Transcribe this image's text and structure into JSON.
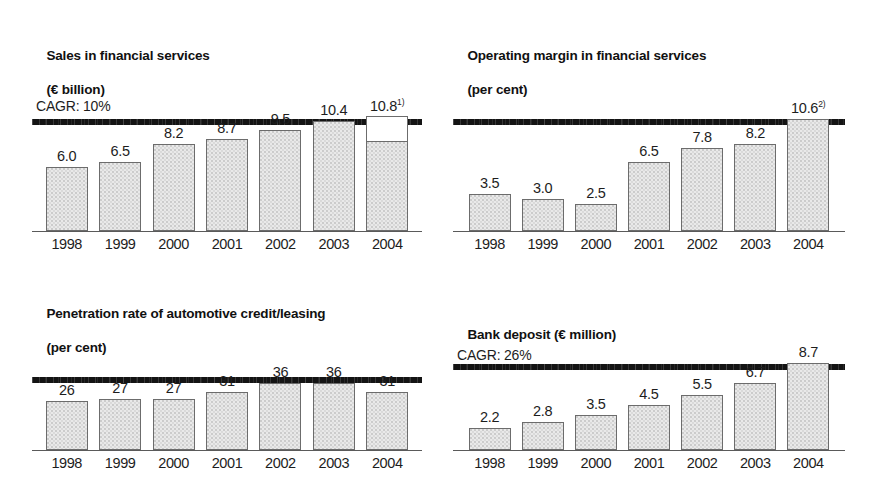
{
  "page": {
    "background": "#ffffff",
    "bar_fill_color": "#e9e9e9",
    "bar_border_color": "#6c6c6c",
    "rule_color": "#141414",
    "text_color": "#1d1d1d"
  },
  "panels": [
    {
      "id": "sales-financial-services",
      "title_line1": "Sales in financial services",
      "title_line2": "(€ billion)",
      "cagr": "CAGR: 10%",
      "chart_data": {
        "type": "bar",
        "title": "Sales in financial services",
        "subtitle": "(€ billion)",
        "xlabel": "",
        "ylabel": "€ billion",
        "ylim": [
          0,
          11.5
        ],
        "grid": false,
        "legend": "none",
        "annotations": [
          "CAGR: 10%"
        ],
        "categories": [
          "1998",
          "1999",
          "2000",
          "2001",
          "2002",
          "2003",
          "2004"
        ],
        "values": [
          6.0,
          6.5,
          8.2,
          8.7,
          9.5,
          10.4,
          10.8
        ],
        "labels": [
          "6.0",
          "6.5",
          "8.2",
          "8.7",
          "9.5",
          "10.4",
          "10.8"
        ],
        "footnote_markers": [
          "",
          "",
          "",
          "",
          "",
          "",
          "1)"
        ],
        "split_bar": {
          "category": "2004",
          "lower_value": 8.4,
          "upper_value": 2.4,
          "upper_style": "white"
        }
      }
    },
    {
      "id": "operating-margin-financial-services",
      "title_line1": "Operating margin in financial services",
      "title_line2": "(per cent)",
      "cagr": "",
      "chart_data": {
        "type": "bar",
        "title": "Operating margin in financial services",
        "subtitle": "(per cent)",
        "xlabel": "",
        "ylabel": "per cent",
        "ylim": [
          0,
          11.5
        ],
        "grid": false,
        "legend": "none",
        "annotations": [],
        "categories": [
          "1998",
          "1999",
          "2000",
          "2001",
          "2002",
          "2003",
          "2004"
        ],
        "values": [
          3.5,
          3.0,
          2.5,
          6.5,
          7.8,
          8.2,
          10.6
        ],
        "labels": [
          "3.5",
          "3.0",
          "2.5",
          "6.5",
          "7.8",
          "8.2",
          "10.6"
        ],
        "footnote_markers": [
          "",
          "",
          "",
          "",
          "",
          "",
          "2)"
        ]
      }
    },
    {
      "id": "penetration-rate-automotive-credit-leasing",
      "title_line1": "Penetration rate of automotive credit/leasing",
      "title_line2": "(per cent)",
      "cagr": "",
      "chart_data": {
        "type": "bar",
        "title": "Penetration rate of automotive credit/leasing",
        "subtitle": "(per cent)",
        "xlabel": "",
        "ylabel": "per cent",
        "ylim": [
          0,
          40
        ],
        "grid": false,
        "legend": "none",
        "annotations": [],
        "categories": [
          "1998",
          "1999",
          "2000",
          "2001",
          "2002",
          "2003",
          "2004"
        ],
        "values": [
          26,
          27,
          27,
          31,
          36,
          36,
          31
        ],
        "labels": [
          "26",
          "27",
          "27",
          "31",
          "36",
          "36",
          "31"
        ],
        "footnote_markers": [
          "",
          "",
          "",
          "",
          "",
          "",
          ""
        ]
      }
    },
    {
      "id": "bank-deposit",
      "title_line1": "Bank deposit (€ million)",
      "title_line2": "",
      "cagr": "CAGR: 26%",
      "chart_data": {
        "type": "bar",
        "title": "Bank deposit (€ million)",
        "subtitle": "",
        "xlabel": "",
        "ylabel": "€ million",
        "ylim": [
          0,
          9.5
        ],
        "grid": false,
        "legend": "none",
        "annotations": [
          "CAGR: 26%"
        ],
        "categories": [
          "1998",
          "1999",
          "2000",
          "2001",
          "2002",
          "2003",
          "2004"
        ],
        "values": [
          2.2,
          2.8,
          3.5,
          4.5,
          5.5,
          6.7,
          8.7
        ],
        "labels": [
          "2.2",
          "2.8",
          "3.5",
          "4.5",
          "5.5",
          "6.7",
          "8.7"
        ],
        "footnote_markers": [
          "",
          "",
          "",
          "",
          "",
          "",
          ""
        ]
      }
    }
  ]
}
